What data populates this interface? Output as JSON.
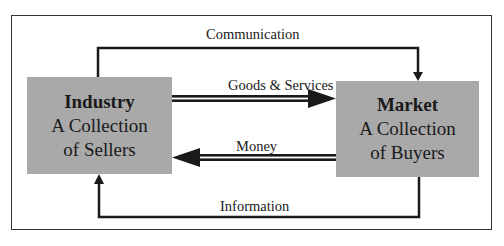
{
  "diagram": {
    "industry": {
      "title": "Industry",
      "line1": "A Collection",
      "line2": "of Sellers"
    },
    "market": {
      "title": "Market",
      "line1": "A Collection",
      "line2": "of Buyers"
    },
    "flows": {
      "communication": "Communication",
      "goods_services": "Goods & Services",
      "money": "Money",
      "information": "Information"
    },
    "colors": {
      "box_fill": "#a9a9a9",
      "line": "#1a1a1a",
      "frame": "#333333"
    }
  }
}
